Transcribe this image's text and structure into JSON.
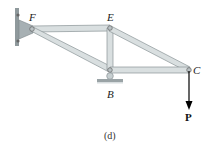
{
  "figure": {
    "caption": "(d)",
    "joints": {
      "F": {
        "label": "F"
      },
      "E": {
        "label": "E"
      },
      "B": {
        "label": "B"
      },
      "C": {
        "label": "C"
      }
    },
    "load": {
      "label": "P",
      "direction": "down",
      "at": "C"
    },
    "supports": [
      {
        "type": "pin-wall",
        "at": "F"
      },
      {
        "type": "roller",
        "at": "B"
      }
    ],
    "members": [
      "FE",
      "FB",
      "EB",
      "EC",
      "BC"
    ],
    "colors": {
      "member_fill": "#d9dfe0",
      "member_stroke": "#8a9497",
      "support": "#9aa3a6",
      "arrow": "#000000"
    }
  }
}
